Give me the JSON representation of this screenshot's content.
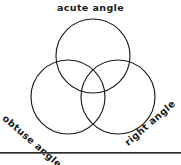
{
  "diagram": {
    "type": "venn-3-circle",
    "title": "",
    "background_color": "#ffffff",
    "stroke_color": "#1a1a1a",
    "text_color": "#1a1a1a",
    "labels": {
      "top": "acute angle",
      "bottom_left": "obtuse angle",
      "bottom_right": "right angle"
    },
    "circles": [
      {
        "name": "acute-angle-circle",
        "cx": 93,
        "cy": 56,
        "r": 37
      },
      {
        "name": "obtuse-angle-circle",
        "cx": 68,
        "cy": 97,
        "r": 37
      },
      {
        "name": "right-angle-circle",
        "cx": 118,
        "cy": 97,
        "r": 37
      }
    ],
    "rule": {
      "name": "bottom-divider",
      "y": 152
    }
  }
}
